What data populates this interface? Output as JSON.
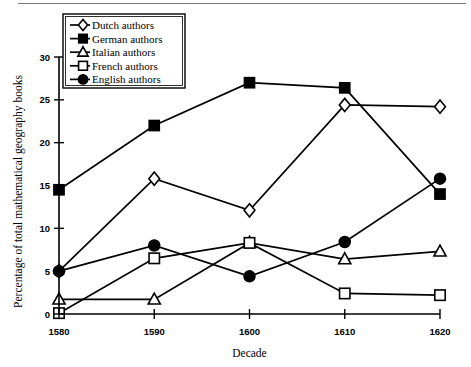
{
  "chart_data": {
    "type": "line",
    "title": "",
    "xlabel": "Decade",
    "ylabel": "Percentage of total mathematical geography books",
    "x": [
      1580,
      1590,
      1600,
      1610,
      1620
    ],
    "categories": [
      "1580",
      "1590",
      "1600",
      "1610",
      "1620"
    ],
    "xlim": [
      1580,
      1620
    ],
    "ylim": [
      0,
      30
    ],
    "yticks": [
      0,
      5,
      10,
      15,
      20,
      25,
      30
    ],
    "xticks": [
      1580,
      1590,
      1600,
      1610,
      1620
    ],
    "grid": false,
    "legend_position": "upper-left",
    "series": [
      {
        "name": "Dutch authors",
        "marker": "open-diamond",
        "values": [
          5.0,
          15.8,
          12.1,
          24.4,
          24.2
        ]
      },
      {
        "name": "German authors",
        "marker": "filled-square",
        "values": [
          14.5,
          22.0,
          27.0,
          26.4,
          14.0
        ]
      },
      {
        "name": "Italian authors",
        "marker": "open-triangle",
        "values": [
          1.7,
          1.7,
          8.3,
          6.4,
          7.3
        ]
      },
      {
        "name": "French authors",
        "marker": "open-square",
        "values": [
          0.1,
          6.5,
          8.3,
          2.4,
          2.2
        ]
      },
      {
        "name": "English authors",
        "marker": "filled-circle",
        "values": [
          5.0,
          8.0,
          4.4,
          8.4,
          15.8
        ]
      }
    ]
  },
  "axes": {
    "y_title": "Percentage of total mathematical geography books",
    "x_title": "Decade",
    "y_tick_labels": [
      "0",
      "5",
      "10",
      "15",
      "20",
      "25",
      "30"
    ],
    "x_tick_labels": [
      "1580",
      "1590",
      "1600",
      "1610",
      "1620"
    ]
  },
  "legend": {
    "entries": [
      {
        "label": "Dutch authors",
        "marker": "open-diamond"
      },
      {
        "label": "German authors",
        "marker": "filled-square"
      },
      {
        "label": "Italian authors",
        "marker": "open-triangle"
      },
      {
        "label": "French authors",
        "marker": "open-square"
      },
      {
        "label": "English authors",
        "marker": "filled-circle"
      }
    ]
  },
  "colors": {
    "ink": "#000000",
    "paper": "#ffffff",
    "rule": "#7b7b7b"
  }
}
